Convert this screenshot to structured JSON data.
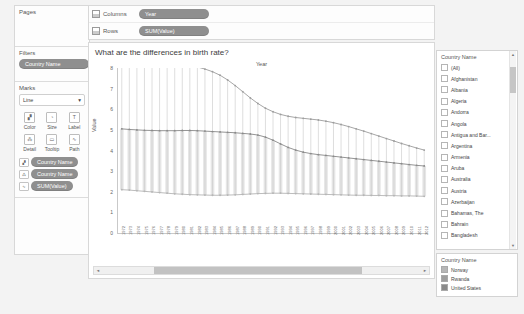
{
  "left_panel": {
    "pages": {
      "title": "Pages"
    },
    "filters": {
      "title": "Filters",
      "pills": [
        "Country Name"
      ]
    },
    "marks": {
      "title": "Marks",
      "mark_type": "Line",
      "caret": "▾",
      "buttons": [
        {
          "label": "Color",
          "icon": "color-palette-icon",
          "glyph": "▞"
        },
        {
          "label": "Size",
          "icon": "size-icon",
          "glyph": "◔"
        },
        {
          "label": "Label",
          "icon": "label-icon",
          "glyph": "T"
        },
        {
          "label": "Detail",
          "icon": "detail-icon",
          "glyph": "⁂"
        },
        {
          "label": "Tooltip",
          "icon": "tooltip-icon",
          "glyph": "▭"
        },
        {
          "label": "Path",
          "icon": "path-icon",
          "glyph": "∿"
        }
      ],
      "pills": [
        {
          "label": "Country Name",
          "role_icon": "color-palette-icon",
          "glyph": "▞"
        },
        {
          "label": "Country Name",
          "role_icon": "detail-icon",
          "glyph": "⁂"
        },
        {
          "label": "SUM(Value)",
          "role_icon": "path-icon",
          "glyph": "∿"
        }
      ]
    }
  },
  "shelves": [
    {
      "name": "Columns",
      "icon": "grid-icon",
      "pill": "Year"
    },
    {
      "name": "Rows",
      "icon": "grid-icon",
      "pill": "SUM(Value)"
    }
  ],
  "view": {
    "title": "What are the differences in birth rate?",
    "column_header": "Year",
    "scroll": {
      "left_arrow": "◄",
      "right_arrow": "►"
    }
  },
  "filter_card": {
    "title": "Country Name",
    "items": [
      "(All)",
      "Afghanistan",
      "Albania",
      "Algeria",
      "Andorra",
      "Angola",
      "Antigua and Bar...",
      "Argentina",
      "Armenia",
      "Aruba",
      "Australia",
      "Austria",
      "Azerbaijan",
      "Bahamas, The",
      "Bahrain",
      "Bangladesh",
      "Barbados",
      "Belarus",
      "Belgium",
      "Belize"
    ],
    "scroll": {
      "up_arrow": "▲",
      "down_arrow": "▼"
    }
  },
  "legend": {
    "title": "Country Name",
    "items": [
      {
        "label": "Norway",
        "color": "#b6b6b6"
      },
      {
        "label": "Rwanda",
        "color": "#9e9e9e"
      },
      {
        "label": "United States",
        "color": "#8a8a8a"
      }
    ]
  },
  "chart_data": {
    "type": "line",
    "title": "What are the differences in birth rate?",
    "xlabel": "Year",
    "ylabel": "Value",
    "ylim": [
      0,
      8
    ],
    "yticks": [
      0,
      1,
      2,
      3,
      4,
      5,
      6,
      7,
      8
    ],
    "grid": false,
    "legend_position": "right",
    "x": [
      1972,
      1973,
      1974,
      1975,
      1976,
      1977,
      1978,
      1979,
      1980,
      1981,
      1982,
      1983,
      1984,
      1985,
      1986,
      1987,
      1988,
      1989,
      1990,
      1991,
      1992,
      1993,
      1994,
      1995,
      1996,
      1997,
      1998,
      1999,
      2000,
      2001,
      2002,
      2003,
      2004,
      2005,
      2006,
      2007,
      2008,
      2009,
      2010,
      2011,
      2012
    ],
    "series": [
      {
        "name": "Rwanda",
        "color": "#9e9e9e",
        "values": [
          8.25,
          8.3,
          8.32,
          8.32,
          8.3,
          8.28,
          8.26,
          8.22,
          8.18,
          8.12,
          8.05,
          7.95,
          7.82,
          7.65,
          7.42,
          7.15,
          6.85,
          6.55,
          6.28,
          6.05,
          5.88,
          5.75,
          5.66,
          5.6,
          5.56,
          5.52,
          5.48,
          5.42,
          5.35,
          5.26,
          5.16,
          5.05,
          4.94,
          4.82,
          4.7,
          4.58,
          4.46,
          4.34,
          4.23,
          4.12,
          4.02
        ]
      },
      {
        "name": "United States",
        "color": "#8a8a8a",
        "values": [
          5.05,
          5.02,
          5.0,
          4.98,
          4.97,
          4.96,
          4.96,
          4.96,
          4.97,
          4.97,
          4.96,
          4.94,
          4.92,
          4.9,
          4.88,
          4.86,
          4.83,
          4.8,
          4.75,
          4.65,
          4.5,
          4.32,
          4.15,
          4.02,
          3.92,
          3.85,
          3.8,
          3.76,
          3.72,
          3.68,
          3.64,
          3.6,
          3.56,
          3.52,
          3.48,
          3.44,
          3.4,
          3.36,
          3.32,
          3.28,
          3.25
        ]
      },
      {
        "name": "Norway",
        "color": "#b6b6b6",
        "values": [
          2.1,
          2.08,
          2.05,
          2.02,
          1.99,
          1.96,
          1.93,
          1.9,
          1.88,
          1.86,
          1.85,
          1.84,
          1.83,
          1.83,
          1.84,
          1.85,
          1.87,
          1.89,
          1.91,
          1.92,
          1.93,
          1.93,
          1.92,
          1.91,
          1.9,
          1.89,
          1.88,
          1.87,
          1.86,
          1.85,
          1.84,
          1.83,
          1.83,
          1.82,
          1.82,
          1.81,
          1.81,
          1.8,
          1.8,
          1.79,
          1.78
        ]
      }
    ]
  }
}
